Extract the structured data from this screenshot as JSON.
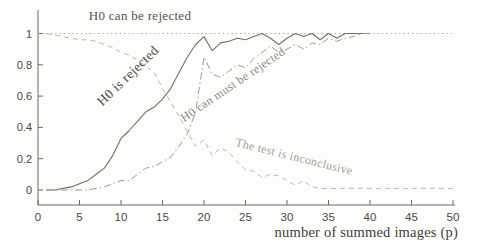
{
  "chart_data": {
    "type": "line",
    "title": "",
    "xlabel": "number of summed images (p)",
    "ylabel": "",
    "xlim": [
      0,
      50
    ],
    "ylim": [
      -0.11,
      1.15
    ],
    "grid": false,
    "legend_position": "none (labels drawn as rotated annotations on curves)",
    "xticks": [
      0,
      5,
      10,
      15,
      20,
      25,
      30,
      35,
      40,
      45,
      50
    ],
    "xtick_labels": [
      "0",
      "5",
      "10",
      "15",
      "20",
      "25",
      "30",
      "35",
      "40",
      "45",
      "50"
    ],
    "yticks": [
      0,
      0.2,
      0.4,
      0.6,
      0.8,
      1
    ],
    "ytick_labels": [
      "0",
      "0.2",
      "0.4",
      "0.6",
      "0.8",
      "1"
    ],
    "colors": {
      "axis": "#6b6962",
      "tick_text": "#4a483f",
      "background": "#fdfdfb"
    },
    "series": [
      {
        "name": "H0 can be rejected",
        "style": "dotted",
        "color": "#a5a39b",
        "x": [
          0,
          50
        ],
        "y": [
          1,
          1
        ]
      },
      {
        "name": "H0 is rejected",
        "style": "solid",
        "color": "#72706a",
        "x": [
          1,
          2,
          3,
          4,
          5,
          6,
          7,
          8,
          9,
          10,
          11,
          12,
          13,
          14,
          15,
          16,
          17,
          18,
          19,
          20,
          21,
          22,
          23,
          24,
          25,
          26,
          27,
          28,
          29,
          30,
          31,
          32,
          33,
          34,
          35,
          36,
          37,
          38,
          39,
          40
        ],
        "y": [
          0.0,
          0.0,
          0.01,
          0.02,
          0.04,
          0.06,
          0.1,
          0.14,
          0.22,
          0.33,
          0.38,
          0.44,
          0.5,
          0.53,
          0.58,
          0.65,
          0.75,
          0.85,
          0.93,
          0.98,
          0.89,
          0.94,
          0.95,
          0.97,
          0.96,
          0.98,
          1.0,
          0.97,
          0.93,
          0.97,
          1.0,
          0.98,
          1.0,
          0.96,
          1.0,
          0.97,
          1.0,
          1.0,
          1.0,
          1.0
        ]
      },
      {
        "name": "H0 can must be rejected",
        "style": "dashdot",
        "color": "#9b9992",
        "x": [
          1,
          2,
          3,
          4,
          5,
          6,
          7,
          8,
          9,
          10,
          11,
          12,
          13,
          14,
          15,
          16,
          17,
          18,
          19,
          20,
          21,
          22,
          23,
          24,
          25,
          26,
          27,
          28,
          29,
          30,
          31,
          32,
          33,
          34,
          35,
          36,
          37,
          38,
          39,
          40
        ],
        "y": [
          0.0,
          0.0,
          0.0,
          0.0,
          0.0,
          0.0,
          0.01,
          0.02,
          0.04,
          0.06,
          0.06,
          0.1,
          0.14,
          0.15,
          0.18,
          0.21,
          0.28,
          0.36,
          0.5,
          0.85,
          0.74,
          0.72,
          0.76,
          0.8,
          0.78,
          0.84,
          0.88,
          0.92,
          0.88,
          0.9,
          0.93,
          0.9,
          0.94,
          0.93,
          0.97,
          0.95,
          0.97,
          0.98,
          1.0,
          1.0
        ]
      },
      {
        "name": "The test is inconclusive",
        "style": "dashed",
        "color": "#b9b7ae",
        "x": [
          1,
          2,
          3,
          4,
          5,
          6,
          7,
          8,
          9,
          10,
          11,
          12,
          13,
          14,
          15,
          16,
          17,
          18,
          19,
          20,
          21,
          22,
          23,
          24,
          25,
          26,
          27,
          28,
          29,
          30,
          31,
          32,
          33,
          34,
          35,
          36,
          37,
          38,
          39,
          40,
          41,
          42,
          43,
          44,
          45,
          46,
          47,
          48,
          49,
          50
        ],
        "y": [
          1.0,
          0.99,
          0.98,
          0.97,
          0.96,
          0.96,
          0.95,
          0.93,
          0.91,
          0.88,
          0.86,
          0.83,
          0.79,
          0.75,
          0.65,
          0.56,
          0.47,
          0.37,
          0.28,
          0.32,
          0.22,
          0.27,
          0.24,
          0.18,
          0.13,
          0.12,
          0.08,
          0.1,
          0.09,
          0.06,
          0.03,
          0.06,
          0.02,
          0.01,
          0.01,
          0.01,
          0.01,
          0.01,
          0.01,
          0.01,
          0.01,
          0.01,
          0.01,
          0.01,
          0.01,
          0.01,
          0.01,
          0.01,
          0.01,
          0.01
        ]
      }
    ],
    "annotations": [
      {
        "text": "H0 can be rejected",
        "x": 140,
        "y": 16,
        "angle": 0,
        "color": "#575349",
        "size": 13
      },
      {
        "text": "H0 is rejected",
        "x": 128,
        "y": 76,
        "angle": -44,
        "color": "#4c4942",
        "size": 13.5
      },
      {
        "text": "H0 can must be rejected",
        "x": 233,
        "y": 85,
        "angle": -34,
        "color": "#8c897f",
        "size": 12
      },
      {
        "text": "The test is inconclusive",
        "x": 294,
        "y": 157,
        "angle": 14,
        "color": "#a3a098",
        "size": 12
      }
    ]
  }
}
